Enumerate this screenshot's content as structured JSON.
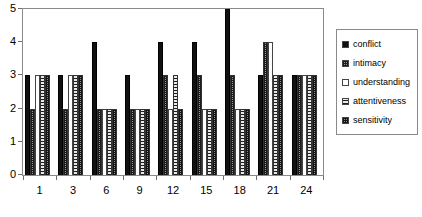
{
  "chart_data": {
    "type": "bar",
    "title": "",
    "subtitle": "",
    "xlabel": "",
    "ylabel": "",
    "ylim": [
      0,
      5
    ],
    "yticks": [
      0,
      1,
      2,
      3,
      4,
      5
    ],
    "grid": false,
    "legend_position": "right",
    "categories": [
      "1",
      "3",
      "6",
      "9",
      "12",
      "15",
      "18",
      "21",
      "24"
    ],
    "series": [
      {
        "name": "conflict",
        "pattern": "solid-black",
        "color": "#111111",
        "values": [
          3,
          3,
          4,
          3,
          4,
          4,
          5,
          3,
          3
        ]
      },
      {
        "name": "intimacy",
        "pattern": "cross-hatch",
        "color": "#9a9a9a",
        "values": [
          2,
          2,
          2,
          2,
          3,
          3,
          3,
          4,
          3
        ]
      },
      {
        "name": "understanding",
        "pattern": "white-empty",
        "color": "#ffffff",
        "values": [
          3,
          3,
          2,
          2,
          2,
          2,
          2,
          4,
          3
        ]
      },
      {
        "name": "attentiveness",
        "pattern": "horizontal-lines",
        "color": "#e9e9e9",
        "values": [
          3,
          3,
          2,
          2,
          3,
          2,
          2,
          3,
          3
        ]
      },
      {
        "name": "sensitivity",
        "pattern": "dotted-checker",
        "color": "#8f8f8f",
        "values": [
          3,
          3,
          2,
          2,
          2,
          2,
          2,
          3,
          3
        ]
      }
    ]
  },
  "legend": {
    "items": [
      {
        "label": "conflict"
      },
      {
        "label": "intimacy"
      },
      {
        "label": "understanding"
      },
      {
        "label": "attentiveness"
      },
      {
        "label": "sensitivity"
      }
    ]
  }
}
